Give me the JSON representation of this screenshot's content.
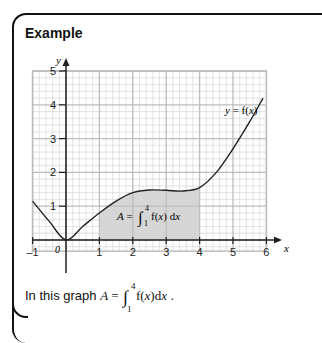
{
  "header": {
    "title": "Example"
  },
  "caption": {
    "prefix": "In this graph ",
    "var": "A",
    "eq": " = ",
    "upper": "4",
    "lower": "1",
    "integrand": "f(x)dx",
    "suffix": " ."
  },
  "chart_data": {
    "type": "line",
    "title": "",
    "xlabel": "x",
    "ylabel": "y",
    "xlim": [
      -1,
      6
    ],
    "ylim": [
      -0.33,
      5
    ],
    "grid": true,
    "x_ticks": [
      "-1",
      "0",
      "1",
      "2",
      "3",
      "4",
      "5",
      "6"
    ],
    "y_ticks": [
      "1",
      "2",
      "3",
      "4",
      "5"
    ],
    "origin_label": "0",
    "series": [
      {
        "name": "y = f(x)",
        "x": [
          -1,
          -0.5,
          0,
          0.5,
          1,
          1.5,
          2,
          2.5,
          3,
          3.5,
          4,
          4.5,
          5,
          5.5,
          5.9
        ],
        "y": [
          1.15,
          0.55,
          0,
          0.4,
          0.8,
          1.15,
          1.4,
          1.48,
          1.47,
          1.45,
          1.55,
          2.0,
          2.7,
          3.5,
          4.2
        ]
      }
    ],
    "annotations": [
      {
        "text": "y = f(x)",
        "x": 5.2,
        "y": 3.75
      },
      {
        "text": "A = ∫₁⁴ f(x) dx",
        "x": 2.5,
        "y": 0.65,
        "shaded_region": [
          1,
          4
        ]
      }
    ]
  },
  "colors": {
    "grid_minor": "#d0d0d0",
    "grid_major": "#bdbdbd",
    "shade": "#d6d6d6",
    "curve": "#222222"
  }
}
